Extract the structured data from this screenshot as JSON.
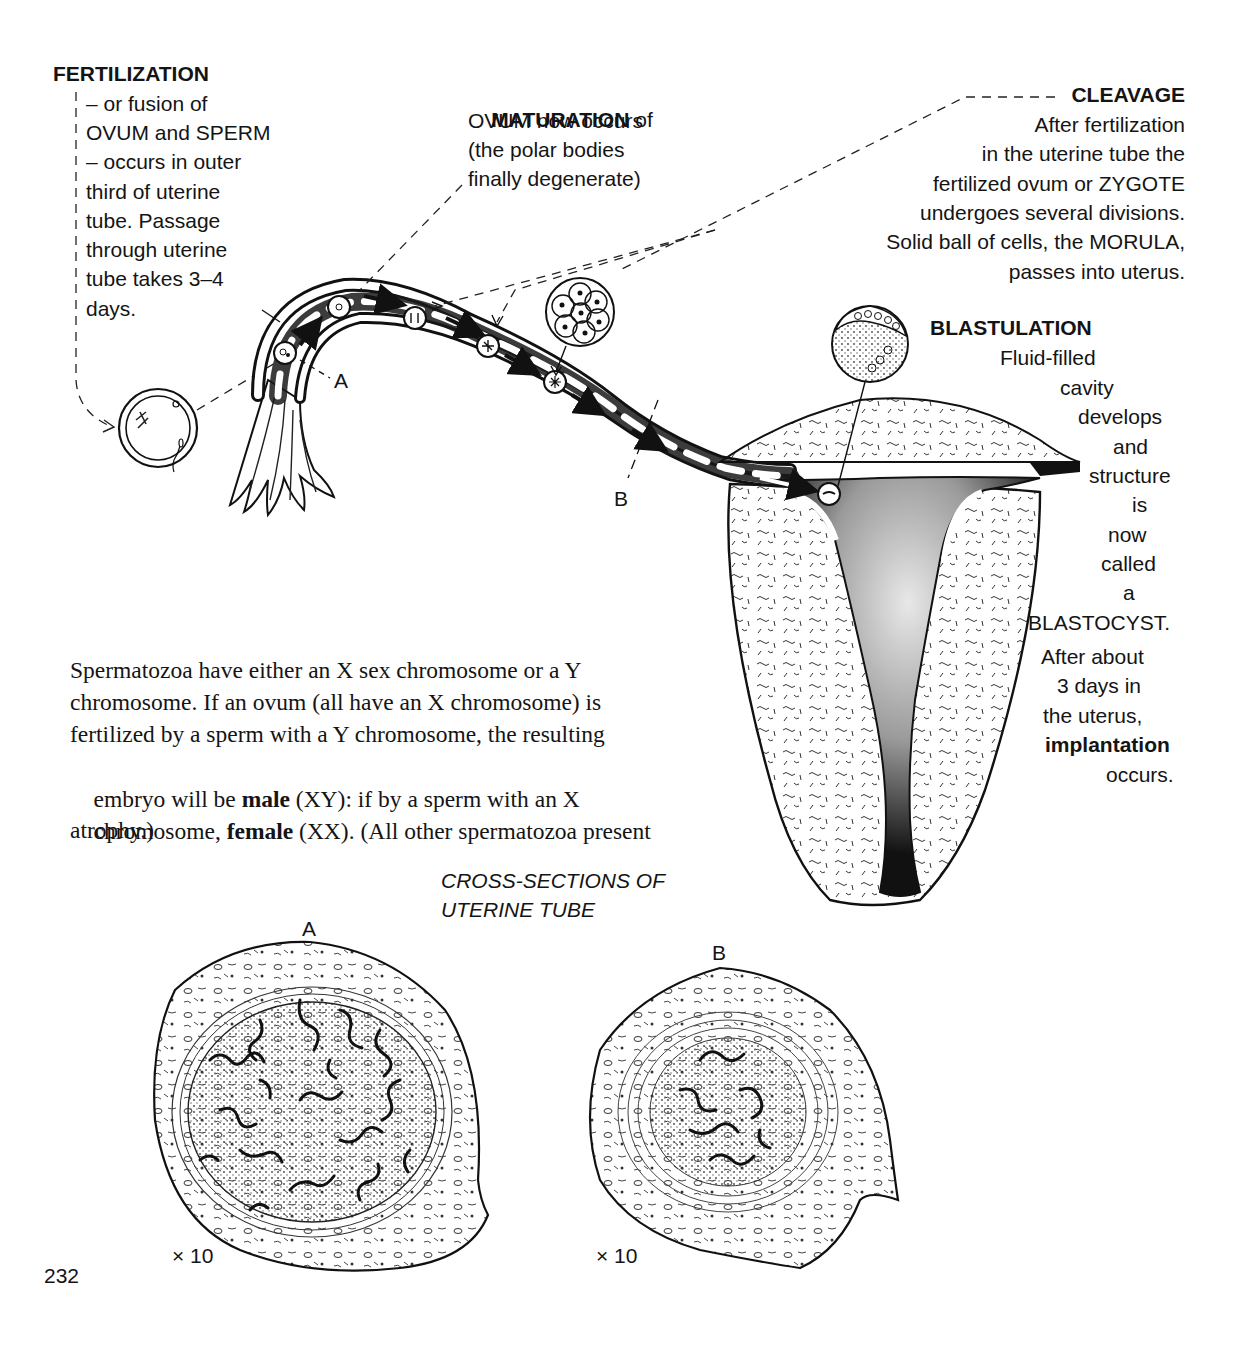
{
  "page_number": "232",
  "fertilization": {
    "heading": "FERTILIZATION",
    "lines": [
      "– or fusion of",
      "OVUM and SPERM",
      "– occurs in outer",
      "third of uterine",
      "tube. Passage",
      "through uterine",
      "tube takes 3–4",
      "days."
    ]
  },
  "maturation": {
    "heading": "MATURATION",
    "heading_suffix": " of",
    "lines": [
      "OVUM now occurs",
      "(the polar bodies",
      "finally degenerate)"
    ]
  },
  "cleavage": {
    "heading": "CLEAVAGE",
    "lines": [
      "After fertilization",
      "in the uterine tube the",
      "fertilized ovum or ZYGOTE",
      "undergoes several divisions.",
      "Solid ball of cells, the MORULA,",
      "passes into uterus."
    ]
  },
  "blastulation": {
    "heading": "BLASTULATION",
    "lines": [
      {
        "text": "Fluid-filled",
        "x": 1000
      },
      {
        "text": "cavity",
        "x": 1060
      },
      {
        "text": "develops",
        "x": 1078
      },
      {
        "text": "and",
        "x": 1113
      },
      {
        "text": "structure",
        "x": 1089
      },
      {
        "text": "is",
        "x": 1132
      },
      {
        "text": "now",
        "x": 1108
      },
      {
        "text": "called",
        "x": 1101
      },
      {
        "text": "a",
        "x": 1123
      },
      {
        "text": "BLASTOCYST.",
        "x": 1028
      },
      {
        "text": "After about",
        "x": 1041
      },
      {
        "text": "3 days in",
        "x": 1057
      },
      {
        "text": "the uterus,",
        "x": 1043
      }
    ],
    "bold_word": "implantation",
    "final_word": "occurs."
  },
  "diagram_labels": {
    "section_a": "A",
    "section_b": "B"
  },
  "chromosome_paragraph": {
    "line1": "Spermatozoa have either an X sex chromosome or a Y",
    "line2": "chromosome. If an ovum (all have an X chromosome) is",
    "line3": "fertilized by a sperm with a Y chromosome, the resulting",
    "line4_pre": "embryo will be ",
    "line4_bold": "male",
    "line4_post": " (XY): if by a sperm with an X",
    "line5_pre": "chromosome, ",
    "line5_bold": "female",
    "line5_post": " (XX). (All other spermatozoa present",
    "line6": "atrophy.)"
  },
  "cross_sections": {
    "title_line1": "CROSS-SECTIONS OF",
    "title_line2": "UTERINE TUBE",
    "label_a": "A",
    "label_b": "B",
    "magnification_a": "× 10",
    "magnification_b": "× 10"
  }
}
